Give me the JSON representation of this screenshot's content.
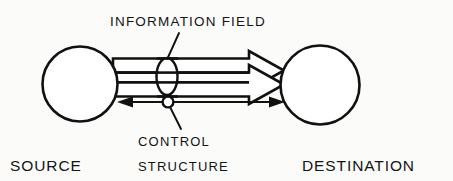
{
  "figure": {
    "kind": "block-diagram",
    "background_color": "#fbfbf9",
    "ink_color": "#111111"
  },
  "labels": {
    "information_field": "INFORMATION FIELD",
    "control_line1": "CONTROL",
    "control_line2": "STRUCTURE",
    "source": "SOURCE",
    "destination": "DESTINATION"
  },
  "nodes": [
    {
      "id": "source",
      "label": "SOURCE",
      "shape": "circle",
      "cx": 80,
      "cy": 84,
      "r": 38
    },
    {
      "id": "destination",
      "label": "DESTINATION",
      "shape": "circle",
      "cx": 320,
      "cy": 85,
      "r": 40
    }
  ],
  "connectors": [
    {
      "id": "information-flow-upper",
      "style": "hollow-block-arrow",
      "direction": "source-to-destination",
      "from": "source",
      "to": "destination"
    },
    {
      "id": "information-flow-lower",
      "style": "hollow-block-arrow",
      "direction": "source-to-destination",
      "from": "source",
      "to": "destination"
    },
    {
      "id": "control-feedback",
      "style": "thin-double-headed-arrow",
      "direction": "bidirectional",
      "from": "source",
      "to": "destination"
    }
  ],
  "annotations": [
    {
      "id": "information-field-marker",
      "label": "INFORMATION FIELD",
      "marker": "vertical-ellipse",
      "marks": [
        "information-flow-upper",
        "information-flow-lower"
      ]
    },
    {
      "id": "control-structure-marker",
      "label": "CONTROL STRUCTURE",
      "marker": "small-circle",
      "marks": [
        "control-feedback"
      ]
    }
  ]
}
